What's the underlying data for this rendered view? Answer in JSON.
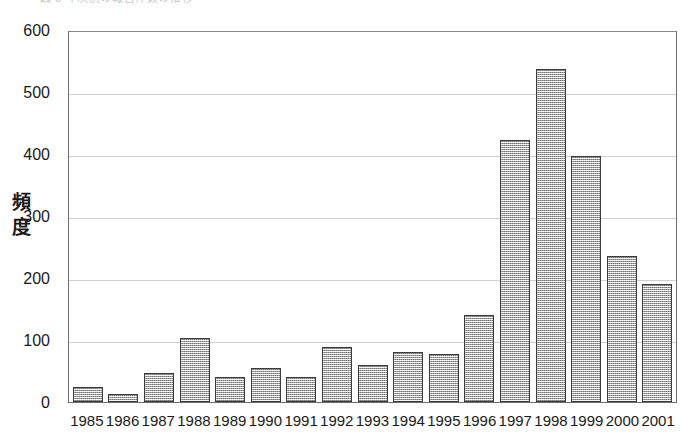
{
  "top_caption": "図 3  年次別の報告件数の推移",
  "y_axis": {
    "title": "頻度",
    "ticks": [
      "600",
      "500",
      "400",
      "300",
      "200",
      "100",
      "0"
    ]
  },
  "x_axis": {
    "ticks": [
      "1985",
      "1986",
      "1987",
      "1988",
      "1989",
      "1990",
      "1991",
      "1992",
      "1993",
      "1994",
      "1995",
      "1996",
      "1997",
      "1998",
      "1999",
      "2000",
      "2001"
    ]
  },
  "chart_data": {
    "type": "bar",
    "title": "",
    "xlabel": "",
    "ylabel": "頻度",
    "ylim": [
      0,
      600
    ],
    "ytick_step": 100,
    "grid": true,
    "legend": "none",
    "bar_fill_color": "#cfcfcf",
    "bar_edge_color": "#3a3a3a",
    "categories": [
      "1985",
      "1986",
      "1987",
      "1988",
      "1989",
      "1990",
      "1991",
      "1992",
      "1993",
      "1994",
      "1995",
      "1996",
      "1997",
      "1998",
      "1999",
      "2000",
      "2001"
    ],
    "values": [
      25,
      13,
      47,
      104,
      41,
      55,
      41,
      88,
      60,
      81,
      78,
      141,
      422,
      537,
      397,
      236,
      190
    ]
  }
}
